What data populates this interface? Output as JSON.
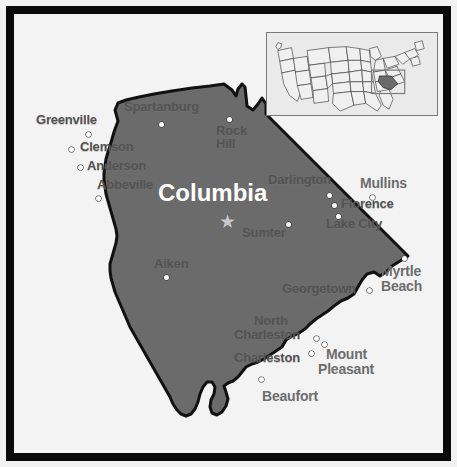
{
  "figure": {
    "frame_color": "#0a0a0a",
    "background_color": "#f3f3f3",
    "state_fill_color": "#6b6b6b",
    "state_outline_color": "#111111",
    "capital_label_color": "#ffffff",
    "inside_label_color": "#535353",
    "outside_label_color": "#6d6d6d"
  },
  "capital": {
    "name": "Columbia",
    "marker": "star",
    "marker_glyph": "★"
  },
  "cities_inside": [
    {
      "name": "Greenville",
      "lines": [
        "Greenville"
      ]
    },
    {
      "name": "Spartanburg",
      "lines": [
        "Spartanburg"
      ]
    },
    {
      "name": "Rock Hill",
      "lines": [
        "Rock",
        "Hill"
      ]
    },
    {
      "name": "Clemson",
      "lines": [
        "Clemson"
      ]
    },
    {
      "name": "Anderson",
      "lines": [
        "Anderson"
      ]
    },
    {
      "name": "Abbeville",
      "lines": [
        "Abbeville"
      ]
    },
    {
      "name": "Darlington",
      "lines": [
        "Darlington"
      ]
    },
    {
      "name": "Florence",
      "lines": [
        "Florence"
      ]
    },
    {
      "name": "Lake City",
      "lines": [
        "Lake City"
      ]
    },
    {
      "name": "Sumter",
      "lines": [
        "Sumter"
      ]
    },
    {
      "name": "Aiken",
      "lines": [
        "Aiken"
      ]
    },
    {
      "name": "Georgetown",
      "lines": [
        "Georgetown"
      ]
    },
    {
      "name": "North Charleston",
      "lines": [
        "North",
        "Charleston"
      ]
    },
    {
      "name": "Charleston",
      "lines": [
        "Charleston"
      ]
    }
  ],
  "cities_outside": [
    {
      "name": "Mullins",
      "lines": [
        "Mullins"
      ]
    },
    {
      "name": "Myrtle Beach",
      "lines": [
        "Myrtle",
        "Beach"
      ]
    },
    {
      "name": "Mount Pleasant",
      "lines": [
        "Mount",
        "Pleasant"
      ]
    },
    {
      "name": "Beaufort",
      "lines": [
        "Beaufort"
      ]
    }
  ],
  "labels": {
    "greenville": "Greenville",
    "spartanburg": "Spartanburg",
    "rock_hill_1": "Rock",
    "rock_hill_2": "Hill",
    "clemson": "Clemson",
    "anderson": "Anderson",
    "abbeville": "Abbeville",
    "columbia": "Columbia",
    "darlington": "Darlington",
    "mullins": "Mullins",
    "florence": "Florence",
    "lake_city": "Lake City",
    "sumter": "Sumter",
    "aiken": "Aiken",
    "myrtle_beach_1": "Myrtle",
    "myrtle_beach_2": "Beach",
    "georgetown": "Georgetown",
    "north_charleston_1": "North",
    "north_charleston_2": "Charleston",
    "charleston": "Charleston",
    "mount_pleasant_1": "Mount",
    "mount_pleasant_2": "Pleasant",
    "beaufort": "Beaufort"
  },
  "inset": {
    "description": "United States locator map",
    "highlighted_state": "South Carolina",
    "highlight_color": "#6b6b6b",
    "box_color": "#7a7a7a",
    "border_color": "#7a7a7a"
  }
}
